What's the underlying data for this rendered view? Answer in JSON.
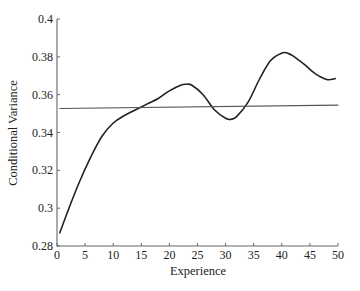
{
  "chart_data": {
    "type": "line",
    "title": "",
    "xlabel": "Experience",
    "ylabel": "Conditional Variance",
    "xlim": [
      0,
      50
    ],
    "ylim": [
      0.28,
      0.4
    ],
    "xticks": [
      0,
      5,
      10,
      15,
      20,
      25,
      30,
      35,
      40,
      45,
      50
    ],
    "yticks": [
      0.28,
      0.3,
      0.32,
      0.34,
      0.36,
      0.38,
      0.4
    ],
    "xtick_labels": [
      "0",
      "5",
      "10",
      "15",
      "20",
      "25",
      "30",
      "35",
      "40",
      "45",
      "50"
    ],
    "ytick_labels": [
      "0.28",
      "0.3",
      "0.32",
      "0.34",
      "0.36",
      "0.38",
      "0.4"
    ],
    "grid": false,
    "legend": null,
    "series": [
      {
        "name": "Nonparametric conditional variance",
        "style": "curve",
        "color": "#222222",
        "x": [
          0.5,
          2,
          4,
          6,
          8,
          10,
          12,
          14,
          16,
          18,
          20,
          22,
          23,
          24,
          26,
          28,
          30,
          31,
          32,
          34,
          36,
          38,
          40,
          41,
          42,
          44,
          46,
          48,
          49.5
        ],
        "y": [
          0.287,
          0.299,
          0.314,
          0.327,
          0.338,
          0.345,
          0.349,
          0.352,
          0.355,
          0.358,
          0.362,
          0.365,
          0.3655,
          0.365,
          0.36,
          0.352,
          0.3475,
          0.347,
          0.3485,
          0.356,
          0.368,
          0.378,
          0.382,
          0.382,
          0.3805,
          0.376,
          0.371,
          0.368,
          0.3685
        ]
      },
      {
        "name": "Parametric (linear) conditional variance",
        "style": "line",
        "color": "#555555",
        "x": [
          0.5,
          50
        ],
        "y": [
          0.3527,
          0.3545
        ]
      }
    ]
  }
}
